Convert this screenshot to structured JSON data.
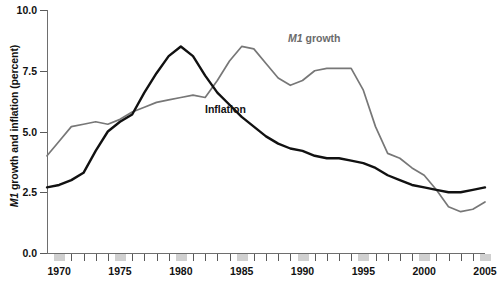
{
  "chart_data": {
    "type": "line",
    "title": "",
    "xlabel": "",
    "ylabel": "M1 growth and inflation (percent)",
    "ylabel_prefix_italic": "M1",
    "ylabel_rest": " growth and inflation (percent)",
    "ylim": [
      0.0,
      10.0
    ],
    "xlim": [
      1969,
      2005
    ],
    "grid": false,
    "legend_position": "inline-annotations",
    "ytick_labels": [
      "0.0",
      "2.5",
      "5.0",
      "7.5",
      "10.0"
    ],
    "ytick_values": [
      0.0,
      2.5,
      5.0,
      7.5,
      10.0
    ],
    "xtick_labels": [
      "1970",
      "1975",
      "1980",
      "1985",
      "1990",
      "1995",
      "2000",
      "2005"
    ],
    "xtick_values": [
      1970,
      1975,
      1980,
      1985,
      1990,
      1995,
      2000,
      2005
    ],
    "x": [
      1969,
      1970,
      1971,
      1972,
      1973,
      1974,
      1975,
      1976,
      1977,
      1978,
      1979,
      1980,
      1981,
      1982,
      1983,
      1984,
      1985,
      1986,
      1987,
      1988,
      1989,
      1990,
      1991,
      1992,
      1993,
      1994,
      1995,
      1996,
      1997,
      1998,
      1999,
      2000,
      2001,
      2002,
      2003,
      2004,
      2005
    ],
    "series": [
      {
        "name": "M1 growth",
        "label": "M1 growth",
        "color": "#777777",
        "values": [
          4.0,
          4.6,
          5.2,
          5.3,
          5.4,
          5.3,
          5.5,
          5.8,
          6.0,
          6.2,
          6.3,
          6.4,
          6.5,
          6.4,
          7.1,
          7.9,
          8.5,
          8.4,
          7.8,
          7.2,
          6.9,
          7.1,
          7.5,
          7.6,
          7.6,
          7.6,
          6.7,
          5.2,
          4.1,
          3.9,
          3.5,
          3.2,
          2.6,
          1.9,
          1.7,
          1.8,
          2.1
        ]
      },
      {
        "name": "Inflation",
        "label": "Inflation",
        "color": "#111111",
        "values": [
          2.7,
          2.8,
          3.0,
          3.3,
          4.2,
          5.0,
          5.4,
          5.7,
          6.6,
          7.4,
          8.1,
          8.5,
          8.1,
          7.3,
          6.6,
          6.1,
          5.6,
          5.2,
          4.8,
          4.5,
          4.3,
          4.2,
          4.0,
          3.9,
          3.9,
          3.8,
          3.7,
          3.5,
          3.2,
          3.0,
          2.8,
          2.7,
          2.6,
          2.5,
          2.5,
          2.6,
          2.7
        ]
      }
    ],
    "annotations": [
      {
        "text": "M1 growth",
        "series": "M1 growth",
        "x_px": 288,
        "y_px": 39
      },
      {
        "text": "Inflation",
        "series": "Inflation",
        "x_px": 205,
        "y_px": 110
      }
    ],
    "recession_bands_years": [
      1970,
      1975,
      1980,
      1985,
      1990,
      1995,
      2000,
      2005
    ]
  },
  "colors": {
    "m1_series": "#777777",
    "inflation_series": "#111111",
    "axis": "#6e6e6e",
    "band": "#d0d0d0",
    "text": "#111111",
    "background": "#ffffff"
  }
}
